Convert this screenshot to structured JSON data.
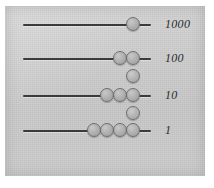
{
  "figure": {
    "panel_color": "#cfcfcf",
    "rod_color": "#3b3b3b",
    "bead_color": "#b2b2b2",
    "bead_outline_color": "#6f6f6f",
    "label_color": "#2b2b2b"
  },
  "rods": [
    {
      "label": "1000",
      "place_value": 1000,
      "bead_count": 1,
      "line": {
        "x": 18,
        "y": 18,
        "width": 128
      },
      "beads": [
        {
          "x": 121,
          "y": 11
        }
      ],
      "label_pos": {
        "x": 160,
        "y": 12
      }
    },
    {
      "label": "100",
      "place_value": 100,
      "bead_count": 2,
      "line": {
        "x": 18,
        "y": 52,
        "width": 128
      },
      "beads": [
        {
          "x": 108,
          "y": 45
        },
        {
          "x": 121,
          "y": 45
        }
      ],
      "label_pos": {
        "x": 160,
        "y": 46
      }
    },
    {
      "label": "10",
      "place_value": 10,
      "bead_count": 3,
      "line": {
        "x": 18,
        "y": 89,
        "width": 128
      },
      "beads": [
        {
          "x": 95,
          "y": 82
        },
        {
          "x": 108,
          "y": 82
        },
        {
          "x": 121,
          "y": 82
        }
      ],
      "label_pos": {
        "x": 160,
        "y": 83
      }
    },
    {
      "label": "1",
      "place_value": 1,
      "bead_count": 4,
      "line": {
        "x": 18,
        "y": 124,
        "width": 128
      },
      "beads": [
        {
          "x": 82,
          "y": 117
        },
        {
          "x": 95,
          "y": 117
        },
        {
          "x": 108,
          "y": 117
        },
        {
          "x": 121,
          "y": 117
        }
      ],
      "label_pos": {
        "x": 160,
        "y": 118
      }
    }
  ],
  "floating_beads": [
    {
      "x": 121,
      "y": 63,
      "between": "100-and-10"
    },
    {
      "x": 121,
      "y": 100,
      "between": "10-and-1"
    }
  ]
}
